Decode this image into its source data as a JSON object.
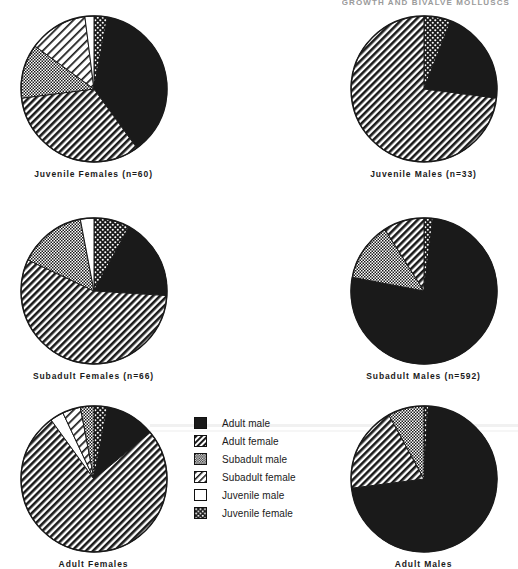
{
  "header": {
    "running_title": "GROWTH AND BIVALVE MOLLUSCS"
  },
  "legend": {
    "title": "Legend",
    "items": [
      {
        "label": "Adult male",
        "pattern": "solid-black",
        "swatch_name": "adult-male"
      },
      {
        "label": "Adult female",
        "pattern": "diagonal-hatch",
        "swatch_name": "adult-female"
      },
      {
        "label": "Subadult male",
        "pattern": "fine-checker",
        "swatch_name": "subadult-male"
      },
      {
        "label": "Subadult female",
        "pattern": "light-diagonal",
        "swatch_name": "subadult-female"
      },
      {
        "label": "Juvenile male",
        "pattern": "white",
        "swatch_name": "juvenile-male"
      },
      {
        "label": "Juvenile female",
        "pattern": "coarse-dots",
        "swatch_name": "juvenile-female"
      }
    ]
  },
  "chart_data": {
    "type": "pie",
    "legend_position": "center",
    "categories": [
      "Adult male",
      "Adult female",
      "Subadult male",
      "Subadult female",
      "Juvenile male",
      "Juvenile female"
    ],
    "charts": [
      {
        "id": "juvenile-females",
        "title": "Juvenile  Females",
        "n_label": "(n=60)",
        "n": 60,
        "caption": "Juvenile  Females  (n=60)",
        "values": [
          37,
          33,
          12,
          13,
          2,
          3
        ],
        "slices": [
          {
            "category": "Juvenile female",
            "percent": 3,
            "pattern": "coarse-dots"
          },
          {
            "category": "Adult male",
            "percent": 37,
            "pattern": "solid-black"
          },
          {
            "category": "Adult female",
            "percent": 33,
            "pattern": "diagonal-hatch"
          },
          {
            "category": "Subadult male",
            "percent": 12,
            "pattern": "fine-checker"
          },
          {
            "category": "Subadult female",
            "percent": 13,
            "pattern": "light-diagonal"
          },
          {
            "category": "Juvenile male",
            "percent": 2,
            "pattern": "white"
          }
        ]
      },
      {
        "id": "juvenile-males",
        "title": "Juvenile  Males",
        "n_label": "(n=33)",
        "n": 33,
        "caption": "Juvenile  Males  (n=33)",
        "values": [
          21,
          73,
          0,
          0,
          0,
          6
        ],
        "slices": [
          {
            "category": "Juvenile female",
            "percent": 6,
            "pattern": "coarse-dots"
          },
          {
            "category": "Adult male",
            "percent": 21,
            "pattern": "solid-black"
          },
          {
            "category": "Adult female",
            "percent": 73,
            "pattern": "diagonal-hatch"
          }
        ]
      },
      {
        "id": "subadult-females",
        "title": "Subadult  Females",
        "n_label": "(n=66)",
        "n": 66,
        "caption": "Subadult  Females  (n=66)",
        "values": [
          18,
          56,
          15,
          0,
          3,
          8
        ],
        "slices": [
          {
            "category": "Juvenile female",
            "percent": 8,
            "pattern": "coarse-dots"
          },
          {
            "category": "Adult male",
            "percent": 18,
            "pattern": "solid-black"
          },
          {
            "category": "Adult female",
            "percent": 56,
            "pattern": "diagonal-hatch"
          },
          {
            "category": "Subadult male",
            "percent": 15,
            "pattern": "fine-checker"
          },
          {
            "category": "Juvenile male",
            "percent": 3,
            "pattern": "white"
          }
        ]
      },
      {
        "id": "subadult-males",
        "title": "Subadult  Males",
        "n_label": "(n=592)",
        "n": 592,
        "caption": "Subadult  Males  (n=592)",
        "values": [
          76,
          9,
          13,
          0,
          0,
          2
        ],
        "slices": [
          {
            "category": "Juvenile female",
            "percent": 2,
            "pattern": "coarse-dots"
          },
          {
            "category": "Adult male",
            "percent": 76,
            "pattern": "solid-black"
          },
          {
            "category": "Subadult male",
            "percent": 13,
            "pattern": "fine-checker"
          },
          {
            "category": "Adult female",
            "percent": 9,
            "pattern": "diagonal-hatch"
          }
        ]
      },
      {
        "id": "adult-females",
        "title": "Adult  Females",
        "n_label": "",
        "n": null,
        "caption": "Adult  Females",
        "values": [
          11,
          76,
          3,
          4,
          3,
          3
        ],
        "slices": [
          {
            "category": "Juvenile female",
            "percent": 3,
            "pattern": "coarse-dots"
          },
          {
            "category": "Adult male",
            "percent": 11,
            "pattern": "solid-black"
          },
          {
            "category": "Adult female",
            "percent": 76,
            "pattern": "diagonal-hatch"
          },
          {
            "category": "Juvenile male",
            "percent": 3,
            "pattern": "white"
          },
          {
            "category": "Subadult female",
            "percent": 4,
            "pattern": "light-diagonal"
          },
          {
            "category": "Subadult male",
            "percent": 3,
            "pattern": "fine-checker"
          }
        ]
      },
      {
        "id": "adult-males",
        "title": "Adult  Males",
        "n_label": "",
        "n": null,
        "caption": "Adult  Males",
        "values": [
          72,
          19,
          8,
          0,
          0,
          1
        ],
        "slices": [
          {
            "category": "Juvenile female",
            "percent": 1,
            "pattern": "coarse-dots"
          },
          {
            "category": "Adult male",
            "percent": 72,
            "pattern": "solid-black"
          },
          {
            "category": "Adult female",
            "percent": 19,
            "pattern": "diagonal-hatch"
          },
          {
            "category": "Subadult male",
            "percent": 8,
            "pattern": "fine-checker"
          }
        ]
      }
    ]
  }
}
